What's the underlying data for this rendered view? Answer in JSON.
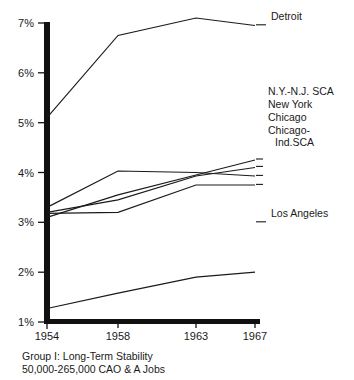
{
  "chart_data": {
    "type": "line",
    "title": "",
    "xlabel": "",
    "ylabel": "",
    "x": [
      1954,
      1958,
      1963,
      1967
    ],
    "xticklabels": [
      "1954",
      "1958",
      "1963",
      "1967"
    ],
    "yticklabels": [
      "1%",
      "2%",
      "3%",
      "4%",
      "5%",
      "6%",
      "7%"
    ],
    "yticks": [
      1,
      2,
      3,
      4,
      5,
      6,
      7
    ],
    "ylim": [
      1,
      7
    ],
    "xlim": [
      1954,
      1967
    ],
    "grid": false,
    "legend_position": "right-of-line-ends",
    "yunit": "%",
    "series": [
      {
        "name": "Detroit",
        "values": [
          5.1,
          6.75,
          7.1,
          6.95
        ]
      },
      {
        "name": "N.Y.-N.J. SCA",
        "values": [
          3.1,
          3.55,
          3.95,
          4.25
        ]
      },
      {
        "name": "New York",
        "values": [
          3.2,
          3.45,
          3.93,
          4.1
        ]
      },
      {
        "name": "Chicago",
        "values": [
          3.3,
          4.03,
          4.0,
          3.93
        ]
      },
      {
        "name": "Chicago-Ind.SCA",
        "values": [
          3.18,
          3.2,
          3.75,
          3.75
        ]
      },
      {
        "name": "Los Angeles",
        "values": [
          1.27,
          1.58,
          1.9,
          2.0
        ]
      }
    ]
  },
  "axis": {
    "y_ticks": [
      {
        "label": "7%"
      },
      {
        "label": "6%"
      },
      {
        "label": "5%"
      },
      {
        "label": "4%"
      },
      {
        "label": "3%"
      },
      {
        "label": "2%"
      },
      {
        "label": "1%"
      }
    ],
    "x_ticks": [
      {
        "label": "1954"
      },
      {
        "label": "1958"
      },
      {
        "label": "1963"
      },
      {
        "label": "1967"
      }
    ]
  },
  "series_labels": [
    {
      "name": "Detroit",
      "lines": [
        "Detroit"
      ]
    },
    {
      "name": "N.Y.-N.J. SCA",
      "lines": [
        "N.Y.-N.J. SCA"
      ]
    },
    {
      "name": "New York",
      "lines": [
        "New York"
      ]
    },
    {
      "name": "Chicago",
      "lines": [
        "Chicago"
      ]
    },
    {
      "name": "Chicago-Ind.SCA",
      "lines": [
        "Chicago-",
        "Ind.SCA"
      ]
    },
    {
      "name": "Los Angeles",
      "lines": [
        "Los Angeles"
      ]
    }
  ],
  "caption": {
    "line1": "Group I: Long-Term Stability",
    "line2": "50,000-265,000 CAO & A Jobs"
  },
  "colors": {
    "ink": "#1a1a1a",
    "axis": "#111111",
    "background": "#ffffff"
  }
}
